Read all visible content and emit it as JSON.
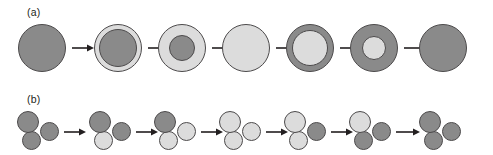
{
  "figure": {
    "width": 493,
    "height": 155,
    "background": "#ffffff",
    "arrow_color": "#231f20",
    "outline_color": "#4c4a4b",
    "colors": {
      "dark_phase": "#8a8a8a",
      "light_phase": "#dcdcdc"
    }
  },
  "panels": [
    {
      "id": "a",
      "label": "(a)",
      "kind": "single-particle-radial-transformation",
      "description": "Single spherical particle transforming shell-by-shell from the dark phase to the light phase and back to the dark phase.",
      "center_y": 48,
      "outer_diameter": 48,
      "stages": [
        {
          "index": 1,
          "center_x": 42,
          "shells": [
            {
              "role": "core",
              "diameter": 48,
              "phase": "dark",
              "color": "#8a8a8a"
            }
          ]
        },
        {
          "index": 2,
          "center_x": 118,
          "shells": [
            {
              "role": "shell",
              "diameter": 48,
              "phase": "light",
              "color": "#dcdcdc"
            },
            {
              "role": "core",
              "diameter": 38,
              "phase": "dark",
              "color": "#8a8a8a"
            }
          ]
        },
        {
          "index": 3,
          "center_x": 182,
          "shells": [
            {
              "role": "shell",
              "diameter": 48,
              "phase": "light",
              "color": "#dcdcdc"
            },
            {
              "role": "core",
              "diameter": 26,
              "phase": "dark",
              "color": "#8a8a8a"
            }
          ]
        },
        {
          "index": 4,
          "center_x": 246,
          "shells": [
            {
              "role": "core",
              "diameter": 48,
              "phase": "light",
              "color": "#dcdcdc"
            }
          ]
        },
        {
          "index": 5,
          "center_x": 310,
          "shells": [
            {
              "role": "shell",
              "diameter": 48,
              "phase": "dark",
              "color": "#8a8a8a"
            },
            {
              "role": "core",
              "diameter": 36,
              "phase": "light",
              "color": "#dcdcdc"
            }
          ]
        },
        {
          "index": 6,
          "center_x": 374,
          "shells": [
            {
              "role": "shell",
              "diameter": 48,
              "phase": "dark",
              "color": "#8a8a8a"
            },
            {
              "role": "core",
              "diameter": 24,
              "phase": "light",
              "color": "#dcdcdc"
            }
          ]
        },
        {
          "index": 7,
          "center_x": 443,
          "shells": [
            {
              "role": "core",
              "diameter": 48,
              "phase": "dark",
              "color": "#8a8a8a"
            }
          ]
        }
      ],
      "arrows": [
        {
          "index": 1,
          "x": 72,
          "y": 43,
          "length": 22
        },
        {
          "index": 2,
          "x": 148,
          "y": 43,
          "length": 21
        },
        {
          "index": 3,
          "x": 212,
          "y": 43,
          "length": 21
        },
        {
          "index": 4,
          "x": 276,
          "y": 43,
          "length": 21
        },
        {
          "index": 5,
          "x": 340,
          "y": 43,
          "length": 21
        },
        {
          "index": 6,
          "x": 404,
          "y": 43,
          "length": 24
        }
      ]
    },
    {
      "id": "b",
      "label": "(b)",
      "kind": "three-particle-cluster-sequential-transformation",
      "description": "Cluster of three touching particles transforming one particle at a time from the dark phase to the light phase and back to the dark phase.",
      "center_y": 130,
      "lobes_geometry": [
        {
          "name": "top-left",
          "dx": -10,
          "dy": -8,
          "diameter": 22
        },
        {
          "name": "right",
          "dx": 11,
          "dy": 1,
          "diameter": 19
        },
        {
          "name": "bottom-left",
          "dx": -7,
          "dy": 10,
          "diameter": 19
        }
      ],
      "stages": [
        {
          "index": 1,
          "center_x": 38,
          "lobes": [
            {
              "name": "top-left",
              "phase": "dark",
              "color": "#8a8a8a",
              "z": 3
            },
            {
              "name": "right",
              "phase": "dark",
              "color": "#8a8a8a",
              "z": 2
            },
            {
              "name": "bottom-left",
              "phase": "dark",
              "color": "#8a8a8a",
              "z": 1
            }
          ]
        },
        {
          "index": 2,
          "center_x": 110,
          "lobes": [
            {
              "name": "top-left",
              "phase": "dark",
              "color": "#8a8a8a",
              "z": 3
            },
            {
              "name": "right",
              "phase": "dark",
              "color": "#8a8a8a",
              "z": 2
            },
            {
              "name": "bottom-left",
              "phase": "light",
              "color": "#dcdcdc",
              "z": 1
            }
          ]
        },
        {
          "index": 3,
          "center_x": 175,
          "lobes": [
            {
              "name": "top-left",
              "phase": "dark",
              "color": "#8a8a8a",
              "z": 3
            },
            {
              "name": "right",
              "phase": "light",
              "color": "#dcdcdc",
              "z": 2
            },
            {
              "name": "bottom-left",
              "phase": "light",
              "color": "#dcdcdc",
              "z": 1
            }
          ]
        },
        {
          "index": 4,
          "center_x": 240,
          "lobes": [
            {
              "name": "top-left",
              "phase": "light",
              "color": "#dcdcdc",
              "z": 3
            },
            {
              "name": "right",
              "phase": "light",
              "color": "#dcdcdc",
              "z": 2
            },
            {
              "name": "bottom-left",
              "phase": "light",
              "color": "#dcdcdc",
              "z": 1
            }
          ]
        },
        {
          "index": 5,
          "center_x": 305,
          "lobes": [
            {
              "name": "top-left",
              "phase": "light",
              "color": "#dcdcdc",
              "z": 3
            },
            {
              "name": "right",
              "phase": "dark",
              "color": "#8a8a8a",
              "z": 2
            },
            {
              "name": "bottom-left",
              "phase": "light",
              "color": "#dcdcdc",
              "z": 1
            }
          ]
        },
        {
          "index": 6,
          "center_x": 370,
          "lobes": [
            {
              "name": "top-left",
              "phase": "light",
              "color": "#dcdcdc",
              "z": 3
            },
            {
              "name": "right",
              "phase": "dark",
              "color": "#8a8a8a",
              "z": 2
            },
            {
              "name": "bottom-left",
              "phase": "dark",
              "color": "#8a8a8a",
              "z": 1
            }
          ]
        },
        {
          "index": 7,
          "center_x": 440,
          "lobes": [
            {
              "name": "top-left",
              "phase": "dark",
              "color": "#8a8a8a",
              "z": 3
            },
            {
              "name": "right",
              "phase": "dark",
              "color": "#8a8a8a",
              "z": 2
            },
            {
              "name": "bottom-left",
              "phase": "dark",
              "color": "#8a8a8a",
              "z": 1
            }
          ]
        }
      ],
      "arrows": [
        {
          "index": 1,
          "x": 64,
          "y": 127,
          "length": 22
        },
        {
          "index": 2,
          "x": 136,
          "y": 127,
          "length": 22
        },
        {
          "index": 3,
          "x": 201,
          "y": 127,
          "length": 22
        },
        {
          "index": 4,
          "x": 266,
          "y": 127,
          "length": 22
        },
        {
          "index": 5,
          "x": 331,
          "y": 127,
          "length": 22
        },
        {
          "index": 6,
          "x": 396,
          "y": 127,
          "length": 24
        }
      ]
    }
  ]
}
